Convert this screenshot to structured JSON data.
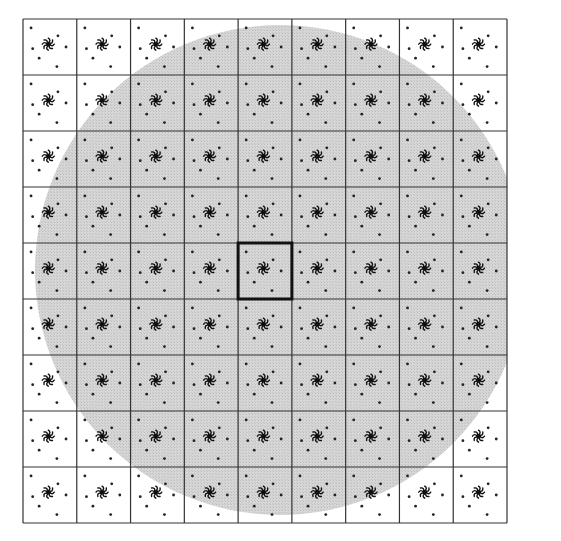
{
  "diagram": {
    "grid": {
      "rows": 9,
      "cols": 9,
      "x0": 23,
      "y0": 19,
      "x1": 507,
      "y1": 523,
      "line_color": "#333333"
    },
    "circle": {
      "cx": 280,
      "cy": 270,
      "r": 245,
      "fill": "#d2d2d2"
    },
    "highlighted_cell": {
      "row": 4,
      "col": 4,
      "stroke_width": 3,
      "color": "#111111"
    },
    "cell_pattern": {
      "center_glyph": "pinwheel-icon",
      "dots": [
        [
          0.15,
          0.16
        ],
        [
          0.65,
          0.3
        ],
        [
          0.18,
          0.53
        ],
        [
          0.8,
          0.5
        ],
        [
          0.3,
          0.7
        ],
        [
          0.63,
          0.85
        ]
      ],
      "dot_color": "#222222",
      "glyph_color": "#111111"
    }
  }
}
